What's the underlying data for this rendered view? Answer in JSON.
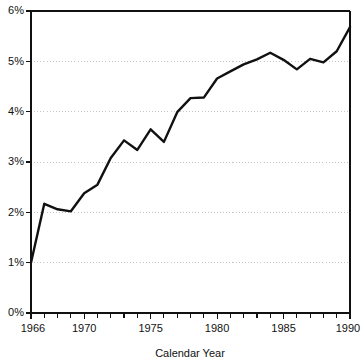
{
  "chart_data": {
    "type": "line",
    "title": "",
    "subtitle": "",
    "xlabel": "Calendar Year",
    "ylabel": "",
    "xlim": [
      1966,
      1990
    ],
    "ylim": [
      0,
      6
    ],
    "grid": true,
    "grid_axis": "y",
    "legend": false,
    "legend_position": "none",
    "y_tick_labels": [
      "0%",
      "1%",
      "2%",
      "3%",
      "4%",
      "5%",
      "6%"
    ],
    "y_tick_values": [
      0,
      1,
      2,
      3,
      4,
      5,
      6
    ],
    "y_unit": "%",
    "x_tick_labels": [
      "1966",
      "1970",
      "1975",
      "1980",
      "1985",
      "1990"
    ],
    "x_tick_values": [
      1966,
      1970,
      1975,
      1980,
      1985,
      1990
    ],
    "x_minor_tick_step": 1,
    "series": [
      {
        "name": "rate",
        "color": "#111111",
        "x": [
          1966,
          1967,
          1968,
          1969,
          1970,
          1971,
          1972,
          1973,
          1974,
          1975,
          1976,
          1977,
          1978,
          1979,
          1980,
          1981,
          1982,
          1983,
          1984,
          1985,
          1986,
          1987,
          1988,
          1989,
          1990
        ],
        "values": [
          1.0,
          2.17,
          2.06,
          2.02,
          2.38,
          2.55,
          3.08,
          3.43,
          3.24,
          3.65,
          3.4,
          3.99,
          4.27,
          4.28,
          4.66,
          4.8,
          4.94,
          5.04,
          5.17,
          5.03,
          4.84,
          5.05,
          4.98,
          5.2,
          5.68
        ]
      }
    ],
    "annotations": []
  },
  "axis": {
    "x_title": "Calendar Year"
  }
}
